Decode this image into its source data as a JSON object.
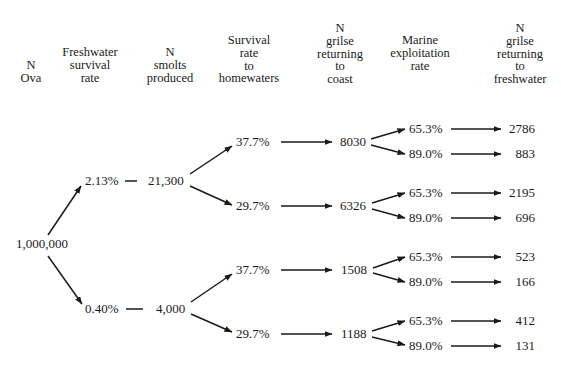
{
  "headers": [
    {
      "id": "ova",
      "lines": [
        "N",
        "Ova"
      ]
    },
    {
      "id": "fw_survival",
      "lines": [
        "Freshwater",
        "survival",
        "rate"
      ]
    },
    {
      "id": "smolts",
      "lines": [
        "N",
        "smolts",
        "produced"
      ]
    },
    {
      "id": "survival_home",
      "lines": [
        "Survival",
        "rate",
        "to",
        "homewaters"
      ]
    },
    {
      "id": "grilse_coast",
      "lines": [
        "N",
        "grilse",
        "returning",
        "to",
        "coast"
      ]
    },
    {
      "id": "marine_exploit",
      "lines": [
        "Marine",
        "exploitation",
        "rate"
      ]
    },
    {
      "id": "grilse_fw",
      "lines": [
        "N",
        "grilse",
        "returning",
        "to",
        "freshwater"
      ]
    }
  ],
  "root": {
    "ova": "1,000,000"
  },
  "branches": [
    {
      "fw_rate": "2.13%",
      "smolts": "21,300",
      "paths": [
        {
          "home_rate": "37.7%",
          "coast": "8030",
          "outcomes": [
            {
              "marine": "65.3%",
              "freshwater": "2786"
            },
            {
              "marine": "89.0%",
              "freshwater": "883"
            }
          ]
        },
        {
          "home_rate": "29.7%",
          "coast": "6326",
          "outcomes": [
            {
              "marine": "65.3%",
              "freshwater": "2195"
            },
            {
              "marine": "89.0%",
              "freshwater": "696"
            }
          ]
        }
      ]
    },
    {
      "fw_rate": "0.40%",
      "smolts": "4,000",
      "paths": [
        {
          "home_rate": "37.7%",
          "coast": "1508",
          "outcomes": [
            {
              "marine": "65.3%",
              "freshwater": "523"
            },
            {
              "marine": "89.0%",
              "freshwater": "166"
            }
          ]
        },
        {
          "home_rate": "29.7%",
          "coast": "1188",
          "outcomes": [
            {
              "marine": "65.3%",
              "freshwater": "412"
            },
            {
              "marine": "89.0%",
              "freshwater": "131"
            }
          ]
        }
      ]
    }
  ]
}
